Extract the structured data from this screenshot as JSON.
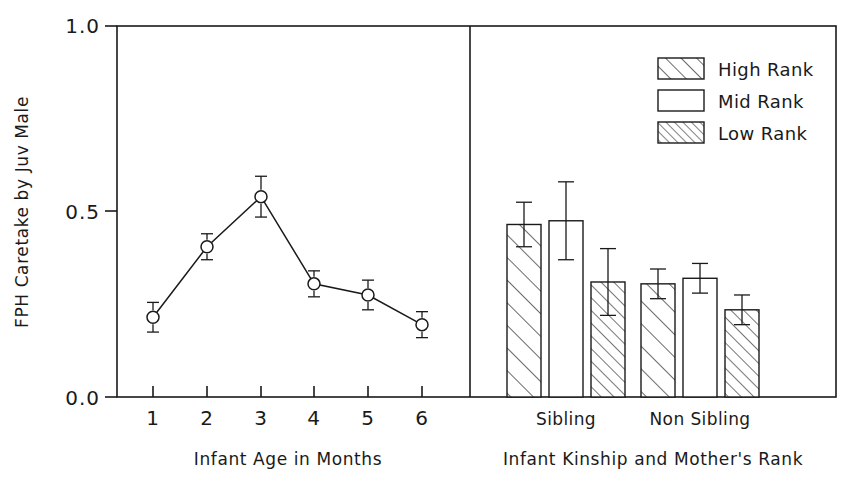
{
  "chart_data": [
    {
      "type": "line",
      "panel": "left",
      "title": "",
      "xlabel": "Infant Age in Months",
      "ylabel": "FPH Caretake by Juv Male",
      "x": [
        1,
        2,
        3,
        4,
        5,
        6
      ],
      "xticklabels": [
        "1",
        "2",
        "3",
        "4",
        "5",
        "6"
      ],
      "values": [
        0.215,
        0.405,
        0.54,
        0.305,
        0.275,
        0.195
      ],
      "errors": [
        0.04,
        0.035,
        0.055,
        0.035,
        0.04,
        0.035
      ],
      "ylim": [
        0.0,
        1.0
      ],
      "yticks": [
        0.0,
        0.5,
        1.0
      ],
      "yticklabels": [
        "0.0",
        "0.5",
        "1.0"
      ],
      "marker": "open-circle",
      "grid": false,
      "legend": "none"
    },
    {
      "type": "bar",
      "panel": "right",
      "title": "",
      "xlabel": "Infant Kinship and Mother's Rank",
      "ylabel": "FPH Caretake by Juv Male",
      "categories": [
        "Sibling",
        "Non Sibling"
      ],
      "series": [
        {
          "name": "High Rank",
          "pattern": "coarse-hatch",
          "values": [
            0.465,
            0.305
          ],
          "errors": [
            0.06,
            0.04
          ]
        },
        {
          "name": "Mid Rank",
          "pattern": "empty",
          "values": [
            0.475,
            0.32
          ],
          "errors": [
            0.105,
            0.04
          ]
        },
        {
          "name": "Low Rank",
          "pattern": "fine-hatch",
          "values": [
            0.31,
            0.235
          ],
          "errors": [
            0.09,
            0.04
          ]
        }
      ],
      "ylim": [
        0.0,
        1.0
      ],
      "grid": false,
      "legend_position": "top-right"
    }
  ],
  "legend": {
    "entries": [
      {
        "label": "High Rank",
        "pattern": "coarse-hatch"
      },
      {
        "label": "Mid Rank",
        "pattern": "empty"
      },
      {
        "label": "Low Rank",
        "pattern": "fine-hatch"
      }
    ]
  },
  "axes": {
    "y_label": "FPH Caretake by Juv Male",
    "y_ticks": [
      "1.0",
      "0.5",
      "0.0"
    ],
    "left_x_label": "Infant Age in Months",
    "left_x_ticks": [
      "1",
      "2",
      "3",
      "4",
      "5",
      "6"
    ],
    "right_x_label": "Infant Kinship and Mother's Rank",
    "right_x_ticks": [
      "Sibling",
      "Non Sibling"
    ]
  },
  "colors": {
    "ink": "#1a1a1a",
    "background": "#ffffff"
  }
}
